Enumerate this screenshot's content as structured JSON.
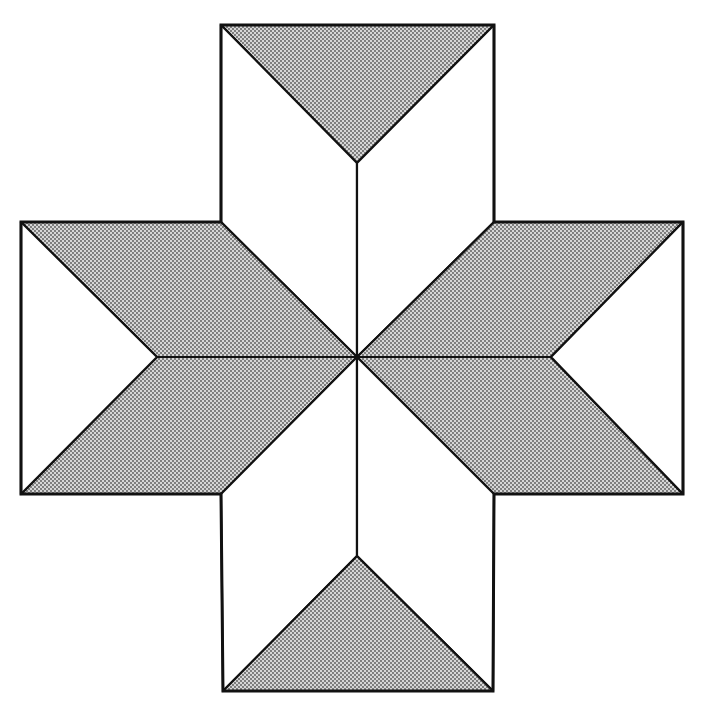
{
  "diagram": {
    "title": "",
    "colors": {
      "background": "#ffffff",
      "stroke": "#111111",
      "shade": "#cfcfcf",
      "dot": "#555555"
    },
    "center": [
      357,
      357
    ],
    "shapes": [
      {
        "name": "top-triangle",
        "fill": "shade",
        "points": "221,25 494,25 357,163"
      },
      {
        "name": "top-left-rhombus",
        "fill": "white",
        "points": "221,25 357,163 357,357 221,222"
      },
      {
        "name": "top-right-rhombus",
        "fill": "white",
        "points": "494,25 357,163 357,357 494,222"
      },
      {
        "name": "left-upper-rhombus",
        "fill": "shade",
        "points": "21,222 221,222 357,357 157,357"
      },
      {
        "name": "left-lower-rhombus",
        "fill": "shade",
        "points": "157,357 357,357 221,494 21,494"
      },
      {
        "name": "left-triangle",
        "fill": "white",
        "points": "21,222 157,357 21,494"
      },
      {
        "name": "right-upper-rhombus",
        "fill": "shade",
        "points": "494,222 683,222 551,357 357,357"
      },
      {
        "name": "right-lower-rhombus",
        "fill": "shade",
        "points": "357,357 551,357 683,494 494,494"
      },
      {
        "name": "right-triangle",
        "fill": "white",
        "points": "683,222 683,494 551,357"
      },
      {
        "name": "bottom-left-rhombus",
        "fill": "white",
        "points": "221,494 357,357 357,556 223,691"
      },
      {
        "name": "bottom-right-rhombus",
        "fill": "white",
        "points": "494,494 357,357 357,556 493,691"
      },
      {
        "name": "bottom-triangle",
        "fill": "shade",
        "points": "223,691 493,691 357,556"
      }
    ],
    "outline": "221,25 494,25 494,222 683,222 683,494 494,494 493,691 223,691 221,494 21,494 21,222 221,222"
  }
}
